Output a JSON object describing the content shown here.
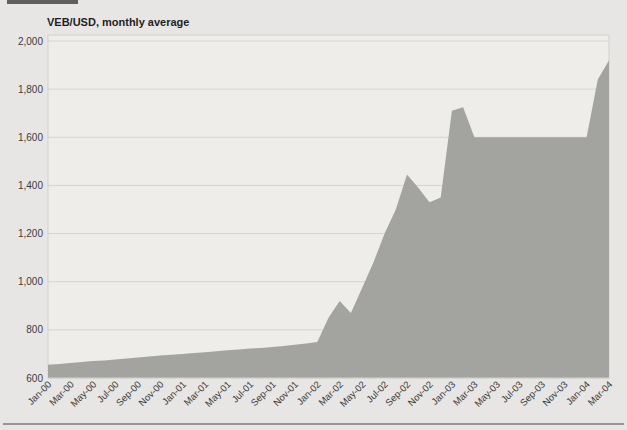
{
  "page": {
    "background_color": "#e7e6e4",
    "top_tab_color": "#5f5f5f",
    "bottom_rule_color": "#969694"
  },
  "chart_data": {
    "type": "area",
    "title": "VEB/USD, monthly average",
    "xlabel": "",
    "ylabel": "",
    "legend": "none",
    "grid": "horizontal",
    "ylim": [
      600,
      2000
    ],
    "ytick_values": [
      600,
      800,
      1000,
      1200,
      1400,
      1600,
      1800,
      2000
    ],
    "ytick_labels": [
      "600",
      "800",
      "1,000",
      "1,200",
      "1,400",
      "1,600",
      "1,800",
      "2,000"
    ],
    "xtick_every": 2,
    "xtick_labels": [
      "Jan-00",
      "Mar-00",
      "May-00",
      "Jul-00",
      "Sep-00",
      "Nov-00",
      "Jan-01",
      "Mar-01",
      "May-01",
      "Jul-01",
      "Sep-01",
      "Nov-01",
      "Jan-02",
      "Mar-02",
      "May-02",
      "Jul-02",
      "Sep-02",
      "Nov-02",
      "Jan-03",
      "Mar-03",
      "May-03",
      "Jul-03",
      "Sep-03",
      "Nov-03",
      "Jan-04",
      "Mar-04"
    ],
    "categories": [
      "Jan-00",
      "Feb-00",
      "Mar-00",
      "Apr-00",
      "May-00",
      "Jun-00",
      "Jul-00",
      "Aug-00",
      "Sep-00",
      "Oct-00",
      "Nov-00",
      "Dec-00",
      "Jan-01",
      "Feb-01",
      "Mar-01",
      "Apr-01",
      "May-01",
      "Jun-01",
      "Jul-01",
      "Aug-01",
      "Sep-01",
      "Oct-01",
      "Nov-01",
      "Dec-01",
      "Jan-02",
      "Feb-02",
      "Mar-02",
      "Apr-02",
      "May-02",
      "Jun-02",
      "Jul-02",
      "Aug-02",
      "Sep-02",
      "Oct-02",
      "Nov-02",
      "Dec-02",
      "Jan-03",
      "Feb-03",
      "Mar-03",
      "Apr-03",
      "May-03",
      "Jun-03",
      "Jul-03",
      "Aug-03",
      "Sep-03",
      "Oct-03",
      "Nov-03",
      "Dec-03",
      "Jan-04",
      "Feb-04",
      "Mar-04"
    ],
    "values": [
      655,
      658,
      662,
      666,
      670,
      673,
      677,
      681,
      685,
      689,
      693,
      697,
      700,
      704,
      707,
      711,
      715,
      718,
      722,
      725,
      729,
      733,
      738,
      743,
      750,
      850,
      920,
      870,
      975,
      1080,
      1200,
      1300,
      1445,
      1390,
      1330,
      1350,
      1710,
      1725,
      1600,
      1600,
      1600,
      1600,
      1600,
      1600,
      1600,
      1600,
      1600,
      1600,
      1600,
      1840,
      1920
    ],
    "colors": {
      "area_fill": "#a3a3a0",
      "plot_background": "#eeedea",
      "gridline": "#d4d4d0",
      "frame": "#d0d0cc",
      "tick_text": "#3c3c3c"
    }
  }
}
